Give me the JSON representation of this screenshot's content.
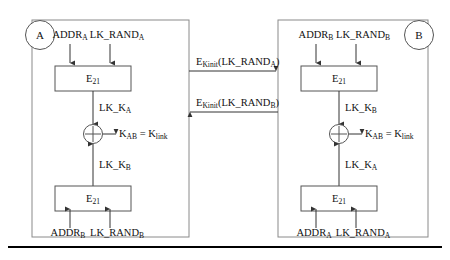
{
  "figure": {
    "stroke_color": "#4a4a4a",
    "text_color": "#111111",
    "panel_border_color": "#7a7a7a",
    "rule_color": "#000000",
    "background": "#ffffff"
  },
  "panels": [
    {
      "id": "panel-a",
      "node_label": "A",
      "top_inputs": [
        "ADDR",
        "LK_RAND"
      ],
      "top_input_subs": [
        "A",
        "A"
      ],
      "top_box_label": "E",
      "top_box_sub": "21",
      "top_output_label": "LK_K",
      "top_output_sub": "A",
      "xor_output_label": "K",
      "xor_output_sub": "AB",
      "xor_output_tail": " = K",
      "xor_output_tail_sub": "link",
      "bottom_output_label": "LK_K",
      "bottom_output_sub": "B",
      "bottom_box_label": "E",
      "bottom_box_sub": "21",
      "bottom_inputs": [
        "ADDR",
        "LK_RAND"
      ],
      "bottom_input_subs": [
        "B",
        "B"
      ]
    },
    {
      "id": "panel-b",
      "node_label": "B",
      "top_inputs": [
        "ADDR",
        "LK_RAND"
      ],
      "top_input_subs": [
        "B",
        "B"
      ],
      "top_box_label": "E",
      "top_box_sub": "21",
      "top_output_label": "LK_K",
      "top_output_sub": "B",
      "xor_output_label": "K",
      "xor_output_sub": "AB",
      "xor_output_tail": " = K",
      "xor_output_tail_sub": "link",
      "bottom_output_label": "LK_K",
      "bottom_output_sub": "A",
      "bottom_box_label": "E",
      "bottom_box_sub": "21",
      "bottom_inputs": [
        "ADDR",
        "LK_RAND"
      ],
      "bottom_input_subs": [
        "A",
        "A"
      ]
    }
  ],
  "messages": [
    {
      "id": "message-a-to-b",
      "direction": "right",
      "prefix": "E",
      "prefix_sub": "Kinit",
      "payload": "(LK_RAND",
      "payload_sub": "A",
      "payload_tail": ")"
    },
    {
      "id": "message-b-to-a",
      "direction": "left",
      "prefix": "E",
      "prefix_sub": "Kinit",
      "payload": "(LK_RAND",
      "payload_sub": "B",
      "payload_tail": ")"
    }
  ]
}
